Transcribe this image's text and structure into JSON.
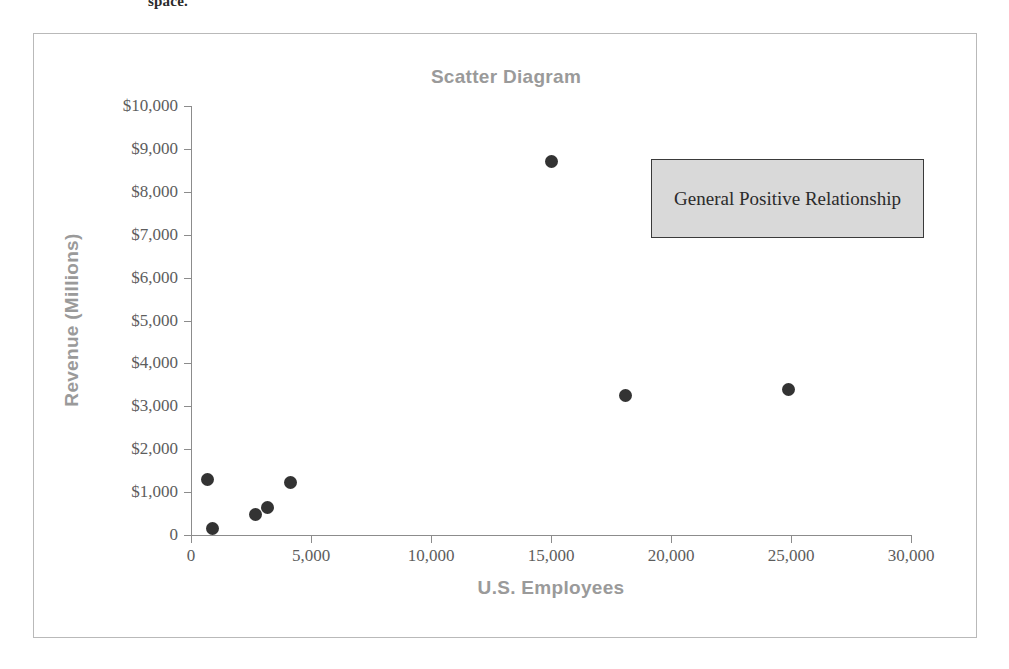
{
  "page": {
    "top_fragment": "space."
  },
  "chart_data": {
    "type": "scatter",
    "title": "Scatter Diagram",
    "xlabel": "U.S. Employees",
    "ylabel": "Revenue (Millions)",
    "xlim": [
      0,
      30000
    ],
    "ylim": [
      0,
      10000
    ],
    "xticks": [
      0,
      5000,
      10000,
      15000,
      20000,
      25000,
      30000
    ],
    "xtick_labels": [
      "0",
      "5,000",
      "10,000",
      "15,000",
      "20,000",
      "25,000",
      "30,000"
    ],
    "yticks": [
      0,
      1000,
      2000,
      3000,
      4000,
      5000,
      6000,
      7000,
      8000,
      9000,
      10000
    ],
    "ytick_labels": [
      "0",
      "$1,000",
      "$2,000",
      "$3,000",
      "$4,000",
      "$5,000",
      "$6,000",
      "$7,000",
      "$8,000",
      "$9,000",
      "$10,000"
    ],
    "grid": false,
    "legend": null,
    "marker_color": "#333333",
    "title_color": "#9a9a9a",
    "axis_color": "#8c8c8c",
    "points": [
      {
        "x": 700,
        "y": 1300
      },
      {
        "x": 900,
        "y": 150
      },
      {
        "x": 2700,
        "y": 480
      },
      {
        "x": 3200,
        "y": 650
      },
      {
        "x": 4150,
        "y": 1230
      },
      {
        "x": 15000,
        "y": 8700
      },
      {
        "x": 18100,
        "y": 3250
      },
      {
        "x": 24900,
        "y": 3400
      }
    ],
    "annotations": [
      {
        "text": "General Positive Relationship",
        "fill": "#d9d9d9",
        "border": "#3a3a3a"
      }
    ]
  }
}
